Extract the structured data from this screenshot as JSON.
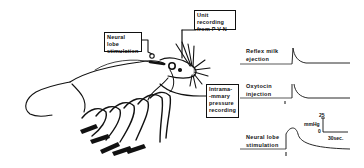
{
  "figure": {
    "boxes": {
      "neural_lobe_stim": [
        "Neural lobe",
        "stimulation"
      ],
      "unit_recording": [
        "Unit recording",
        "from P V N"
      ],
      "intramammary": [
        "Intrama-",
        "-mmary",
        "pressure",
        "recording"
      ]
    },
    "traces": [
      {
        "label": [
          "Reflex milk",
          "ejection"
        ],
        "type": "reflex"
      },
      {
        "label": [
          "Oxytocin",
          "injection"
        ],
        "type": "injection"
      },
      {
        "label": [
          "Neural lobe",
          "stimulation"
        ],
        "type": "stimulation"
      }
    ],
    "scale_bar": {
      "vertical_top": "25",
      "vertical_unit": "mmHg",
      "vertical_bottom": "0",
      "horizontal": "30sec."
    },
    "colors": {
      "ink": "#111111",
      "background": "#ffffff"
    }
  }
}
